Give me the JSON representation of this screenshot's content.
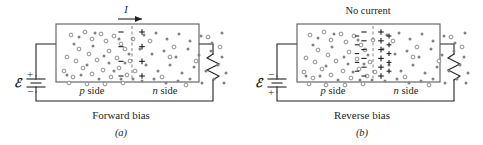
{
  "figure": {
    "colors": {
      "ink": "#231f20",
      "box_stroke": "#58595b",
      "carrier_gray": "#808285",
      "background": "#ffffff"
    },
    "panels": [
      {
        "id": "a",
        "sub_label": "(a)",
        "caption": "Forward bias",
        "top_label": "I",
        "top_label_kind": "current-arrow",
        "emf_symbol": "ℰ",
        "battery_top_sign": "+",
        "battery_bottom_sign": "−",
        "left_region_label_italic": "p",
        "left_region_label_rest": " side",
        "right_region_label_italic": "n",
        "right_region_label_rest": " side",
        "depletion_width": "narrow",
        "junction_negative_signs": 4,
        "junction_positive_signs": 4,
        "has_current": true,
        "resistor_label": "resistor"
      },
      {
        "id": "b",
        "sub_label": "(b)",
        "caption": "Reverse bias",
        "top_label": "No current",
        "top_label_kind": "text",
        "emf_symbol": "ℰ",
        "battery_top_sign": "−",
        "battery_bottom_sign": "+",
        "left_region_label_italic": "p",
        "left_region_label_rest": " side",
        "right_region_label_italic": "n",
        "right_region_label_rest": " side",
        "depletion_width": "wide",
        "junction_negative_signs": 6,
        "junction_positive_signs": 6,
        "has_current": false,
        "resistor_label": "resistor"
      }
    ],
    "legend_meaning": {
      "open_circle": "hole (positive carrier)",
      "filled_dot": "electron (negative carrier)"
    }
  },
  "carriers": {
    "panel_a_holes": [
      [
        12,
        8
      ],
      [
        26,
        5
      ],
      [
        33,
        12
      ],
      [
        42,
        7
      ],
      [
        47,
        14
      ],
      [
        55,
        9
      ],
      [
        62,
        17
      ],
      [
        20,
        22
      ],
      [
        8,
        30
      ],
      [
        17,
        34
      ],
      [
        30,
        27
      ],
      [
        38,
        33
      ],
      [
        50,
        24
      ],
      [
        58,
        31
      ],
      [
        66,
        22
      ],
      [
        71,
        34
      ],
      [
        5,
        44
      ],
      [
        14,
        50
      ],
      [
        24,
        41
      ],
      [
        33,
        47
      ],
      [
        44,
        43
      ],
      [
        52,
        50
      ],
      [
        60,
        41
      ],
      [
        68,
        48
      ],
      [
        10,
        56
      ],
      [
        28,
        57
      ],
      [
        46,
        57
      ],
      [
        64,
        56
      ],
      [
        74,
        12
      ],
      [
        76,
        44
      ]
    ],
    "panel_a_electrons": [
      [
        20,
        10
      ],
      [
        34,
        19
      ],
      [
        45,
        29
      ],
      [
        60,
        12
      ],
      [
        70,
        27
      ],
      [
        15,
        17
      ],
      [
        28,
        38
      ],
      [
        40,
        52
      ],
      [
        55,
        44
      ],
      [
        66,
        36
      ],
      [
        8,
        48
      ],
      [
        22,
        48
      ],
      [
        50,
        36
      ],
      [
        74,
        52
      ],
      [
        36,
        6
      ],
      [
        62,
        52
      ]
    ],
    "panel_a_right_electrons": [
      [
        10,
        8
      ],
      [
        22,
        6
      ],
      [
        33,
        12
      ],
      [
        45,
        7
      ],
      [
        56,
        14
      ],
      [
        67,
        9
      ],
      [
        78,
        16
      ],
      [
        88,
        6
      ],
      [
        6,
        22
      ],
      [
        18,
        27
      ],
      [
        30,
        24
      ],
      [
        42,
        30
      ],
      [
        54,
        22
      ],
      [
        65,
        28
      ],
      [
        77,
        24
      ],
      [
        88,
        30
      ],
      [
        12,
        38
      ],
      [
        24,
        44
      ],
      [
        36,
        38
      ],
      [
        48,
        46
      ],
      [
        60,
        40
      ],
      [
        72,
        44
      ],
      [
        84,
        38
      ],
      [
        92,
        46
      ],
      [
        8,
        54
      ],
      [
        20,
        52
      ],
      [
        32,
        56
      ],
      [
        44,
        54
      ],
      [
        56,
        52
      ],
      [
        68,
        56
      ],
      [
        80,
        52
      ],
      [
        90,
        56
      ]
    ],
    "panel_a_right_holes": [
      [
        16,
        14
      ],
      [
        40,
        20
      ],
      [
        62,
        34
      ],
      [
        28,
        50
      ],
      [
        74,
        10
      ],
      [
        52,
        58
      ],
      [
        86,
        20
      ],
      [
        36,
        30
      ]
    ],
    "panel_b_holes": [
      [
        10,
        8
      ],
      [
        24,
        5
      ],
      [
        31,
        13
      ],
      [
        41,
        7
      ],
      [
        46,
        15
      ],
      [
        54,
        9
      ],
      [
        61,
        18
      ],
      [
        18,
        23
      ],
      [
        6,
        31
      ],
      [
        15,
        35
      ],
      [
        28,
        28
      ],
      [
        36,
        34
      ],
      [
        49,
        25
      ],
      [
        57,
        32
      ],
      [
        65,
        23
      ],
      [
        70,
        35
      ],
      [
        4,
        45
      ],
      [
        13,
        51
      ],
      [
        22,
        42
      ],
      [
        31,
        48
      ],
      [
        43,
        44
      ],
      [
        51,
        51
      ],
      [
        59,
        42
      ],
      [
        67,
        49
      ],
      [
        9,
        57
      ],
      [
        26,
        58
      ],
      [
        45,
        58
      ],
      [
        63,
        57
      ],
      [
        73,
        13
      ],
      [
        75,
        45
      ]
    ],
    "panel_b_electrons": [
      [
        18,
        11
      ],
      [
        32,
        20
      ],
      [
        44,
        30
      ],
      [
        58,
        13
      ],
      [
        68,
        28
      ],
      [
        13,
        18
      ],
      [
        26,
        39
      ],
      [
        38,
        53
      ],
      [
        53,
        45
      ],
      [
        64,
        37
      ],
      [
        6,
        49
      ],
      [
        20,
        49
      ],
      [
        48,
        37
      ],
      [
        72,
        53
      ],
      [
        34,
        7
      ],
      [
        60,
        53
      ]
    ],
    "panel_b_right_electrons": [
      [
        12,
        8
      ],
      [
        24,
        6
      ],
      [
        35,
        12
      ],
      [
        47,
        7
      ],
      [
        58,
        14
      ],
      [
        69,
        9
      ],
      [
        80,
        16
      ],
      [
        90,
        6
      ],
      [
        8,
        22
      ],
      [
        20,
        27
      ],
      [
        32,
        24
      ],
      [
        44,
        30
      ],
      [
        56,
        22
      ],
      [
        67,
        28
      ],
      [
        79,
        24
      ],
      [
        89,
        30
      ],
      [
        14,
        38
      ],
      [
        26,
        44
      ],
      [
        38,
        38
      ],
      [
        50,
        46
      ],
      [
        62,
        40
      ],
      [
        74,
        44
      ],
      [
        85,
        38
      ],
      [
        93,
        46
      ],
      [
        10,
        54
      ],
      [
        22,
        52
      ],
      [
        34,
        56
      ],
      [
        46,
        54
      ],
      [
        58,
        52
      ],
      [
        70,
        56
      ],
      [
        82,
        52
      ],
      [
        91,
        56
      ]
    ],
    "panel_b_right_holes": [
      [
        18,
        14
      ],
      [
        42,
        20
      ],
      [
        64,
        34
      ],
      [
        30,
        50
      ],
      [
        76,
        10
      ],
      [
        54,
        58
      ],
      [
        87,
        20
      ],
      [
        38,
        30
      ]
    ]
  }
}
